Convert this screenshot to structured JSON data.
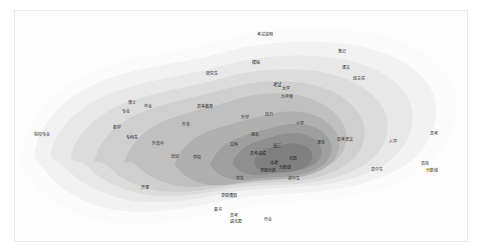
{
  "figure": {
    "background": "#ffffff",
    "panel_background": "#fdfdfd",
    "panel_border": "#e9e9e9"
  },
  "chart_data": {
    "type": "heatmap",
    "title": "",
    "subtitle": "",
    "xlabel": "",
    "ylabel": "",
    "grid": false,
    "legend_position": "none",
    "colorscale": {
      "name": "grayscale-nested-contours",
      "bands": [
        {
          "level": 1,
          "color": "#fbfbfb"
        },
        {
          "level": 2,
          "color": "#f2f2f2"
        },
        {
          "level": 3,
          "color": "#e8e8e8"
        },
        {
          "level": 4,
          "color": "#dcdcdc"
        },
        {
          "level": 5,
          "color": "#cfcfcf"
        },
        {
          "level": 6,
          "color": "#c0c0c0"
        },
        {
          "level": 7,
          "color": "#b0b0b0"
        },
        {
          "level": 8,
          "color": "#9f9f9f"
        },
        {
          "level": 9,
          "color": "#8f8f8f"
        },
        {
          "level": 10,
          "color": "#808080"
        }
      ]
    },
    "axis_ranges": {
      "x": [
        0,
        454
      ],
      "y": [
        0,
        232
      ]
    },
    "points": [
      {
        "label": "院校专业",
        "x": 27,
        "y": 124,
        "band": 1,
        "size": 4.0
      },
      {
        "label": "考试说明",
        "x": 250,
        "y": 24,
        "band": 1,
        "size": 4.0
      },
      {
        "label": "笔记",
        "x": 327,
        "y": 41,
        "band": 1,
        "size": 4.0
      },
      {
        "label": "课文",
        "x": 331,
        "y": 57,
        "band": 1,
        "size": 4.0
      },
      {
        "label": "班主任",
        "x": 344,
        "y": 68,
        "band": 2,
        "size": 4.0
      },
      {
        "label": "研究生",
        "x": 197,
        "y": 63,
        "band": 2,
        "size": 4.0
      },
      {
        "label": "模拟",
        "x": 241,
        "y": 52,
        "band": 2,
        "size": 4.0
      },
      {
        "label": "博士",
        "x": 117,
        "y": 92,
        "band": 3,
        "size": 4.0
      },
      {
        "label": "专业",
        "x": 111,
        "y": 101,
        "band": 3,
        "size": 4.0
      },
      {
        "label": "毕业",
        "x": 133,
        "y": 96,
        "band": 3,
        "size": 4.0
      },
      {
        "label": "数学",
        "x": 102,
        "y": 117,
        "band": 4,
        "size": 4.0
      },
      {
        "label": "高等教育",
        "x": 190,
        "y": 96,
        "band": 4,
        "size": 4.0
      },
      {
        "label": "专科生",
        "x": 117,
        "y": 127,
        "band": 4,
        "size": 4.0
      },
      {
        "label": "升高中",
        "x": 143,
        "y": 133,
        "band": 4,
        "size": 4.0
      },
      {
        "label": "升本",
        "x": 171,
        "y": 114,
        "band": 5,
        "size": 4.0
      },
      {
        "label": "培训",
        "x": 160,
        "y": 146,
        "band": 5,
        "size": 4.0
      },
      {
        "label": "学校",
        "x": 182,
        "y": 147,
        "band": 5,
        "size": 4.0
      },
      {
        "label": "开课",
        "x": 130,
        "y": 177,
        "band": 3,
        "size": 4.0
      },
      {
        "label": "学生",
        "x": 225,
        "y": 168,
        "band": 6,
        "size": 4.0
      },
      {
        "label": "报名",
        "x": 240,
        "y": 124,
        "band": 6,
        "size": 4.0
      },
      {
        "label": "文科",
        "x": 219,
        "y": 134,
        "band": 7,
        "size": 4.0
      },
      {
        "label": "升学",
        "x": 230,
        "y": 107,
        "band": 6,
        "size": 4.0
      },
      {
        "label": "压力",
        "x": 254,
        "y": 104,
        "band": 6,
        "size": 4.0
      },
      {
        "label": "考试",
        "x": 262,
        "y": 74,
        "band": 5,
        "size": 4.5
      },
      {
        "label": "大学",
        "x": 271,
        "y": 78,
        "band": 5,
        "size": 4.0
      },
      {
        "label": "九年级",
        "x": 272,
        "y": 86,
        "band": 5,
        "size": 4.0
      },
      {
        "label": "小学",
        "x": 285,
        "y": 113,
        "band": 5,
        "size": 4.0
      },
      {
        "label": "高考成绩",
        "x": 243,
        "y": 143,
        "band": 8,
        "size": 4.0
      },
      {
        "label": "高三",
        "x": 262,
        "y": 135,
        "band": 9,
        "size": 4.5
      },
      {
        "label": "中考",
        "x": 259,
        "y": 152,
        "band": 9,
        "size": 4.5
      },
      {
        "label": "录取分数",
        "x": 253,
        "y": 160,
        "band": 9,
        "size": 4.0
      },
      {
        "label": "分数线",
        "x": 270,
        "y": 157,
        "band": 8,
        "size": 4.0
      },
      {
        "label": "志愿",
        "x": 278,
        "y": 148,
        "band": 8,
        "size": 4.0
      },
      {
        "label": "初中生",
        "x": 279,
        "y": 168,
        "band": 7,
        "size": 4.0
      },
      {
        "label": "录取通知",
        "x": 214,
        "y": 185,
        "band": 5,
        "size": 4.0
      },
      {
        "label": "高考",
        "x": 219,
        "y": 205,
        "band": 3,
        "size": 4.0
      },
      {
        "label": "填志愿",
        "x": 221,
        "y": 211,
        "band": 3,
        "size": 4.0
      },
      {
        "label": "作业",
        "x": 253,
        "y": 209,
        "band": 3,
        "size": 4.0
      },
      {
        "label": "复习",
        "x": 203,
        "y": 199,
        "band": 4,
        "size": 4.0
      },
      {
        "label": "课本",
        "x": 306,
        "y": 132,
        "band": 4,
        "size": 4.0
      },
      {
        "label": "高考语文",
        "x": 330,
        "y": 129,
        "band": 4,
        "size": 4.0
      },
      {
        "label": "入学",
        "x": 378,
        "y": 131,
        "band": 3,
        "size": 4.0
      },
      {
        "label": "高考",
        "x": 419,
        "y": 123,
        "band": 2,
        "size": 4.0
      },
      {
        "label": "高中生",
        "x": 362,
        "y": 159,
        "band": 2,
        "size": 4.0
      },
      {
        "label": "高校",
        "x": 410,
        "y": 153,
        "band": 2,
        "size": 4.0
      },
      {
        "label": "分数线",
        "x": 417,
        "y": 160,
        "band": 2,
        "size": 4.0
      }
    ]
  }
}
